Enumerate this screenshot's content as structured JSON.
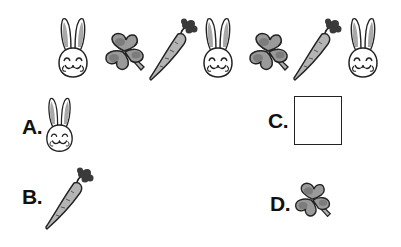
{
  "puzzle": {
    "sequence": [
      {
        "icon": "bunny-icon"
      },
      {
        "icon": "clover-icon"
      },
      {
        "icon": "carrot-icon"
      },
      {
        "icon": "bunny-icon"
      },
      {
        "icon": "clover-icon"
      },
      {
        "icon": "carrot-icon"
      },
      {
        "icon": "bunny-icon"
      }
    ],
    "options": [
      {
        "label": "A.",
        "icon": "bunny-icon"
      },
      {
        "label": "B.",
        "icon": "carrot-icon"
      },
      {
        "label": "C.",
        "icon": "empty-box"
      },
      {
        "label": "D.",
        "icon": "clover-icon"
      }
    ]
  },
  "colors": {
    "outline": "#222222",
    "fill_gray": "#9a9a9a",
    "fill_light": "#b8b8b8",
    "carrot_top": "#3a3a3a"
  }
}
